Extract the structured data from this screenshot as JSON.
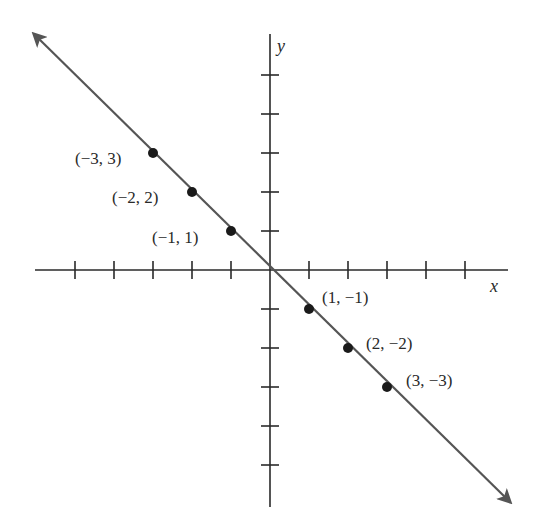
{
  "chart_data": {
    "type": "line",
    "title": "",
    "xlabel": "x",
    "ylabel": "y",
    "xlim": [
      -6,
      6
    ],
    "ylim": [
      -6,
      6
    ],
    "grid": false,
    "x_ticks": [
      -5,
      -4,
      -3,
      -2,
      -1,
      1,
      2,
      3,
      4,
      5
    ],
    "y_ticks": [
      -5,
      -4,
      -3,
      -2,
      -1,
      1,
      2,
      3,
      4,
      5
    ],
    "tick_labels_shown": false,
    "line": {
      "equation": "y = -x",
      "arrows_both_ends": true,
      "color": "#555555"
    },
    "series": [
      {
        "name": "points on y = -x",
        "points": [
          {
            "x": -3,
            "y": 3,
            "label": "(−3, 3)"
          },
          {
            "x": -2,
            "y": 2,
            "label": "(−2, 2)"
          },
          {
            "x": -1,
            "y": 1,
            "label": "(−1, 1)"
          },
          {
            "x": 1,
            "y": -1,
            "label": "(1, −1)"
          },
          {
            "x": 2,
            "y": -2,
            "label": "(2, −2)"
          },
          {
            "x": 3,
            "y": -3,
            "label": "(3, −3)"
          }
        ]
      }
    ]
  },
  "labels": {
    "x_axis": "x",
    "y_axis": "y",
    "p1": "(−3, 3)",
    "p2": "(−2, 2)",
    "p3": "(−1, 1)",
    "p4": "(1, −1)",
    "p5": "(2, −2)",
    "p6": "(3, −3)"
  },
  "colors": {
    "axis": "#2a2a2a",
    "line": "#555555",
    "point": "#1a1a1a"
  }
}
